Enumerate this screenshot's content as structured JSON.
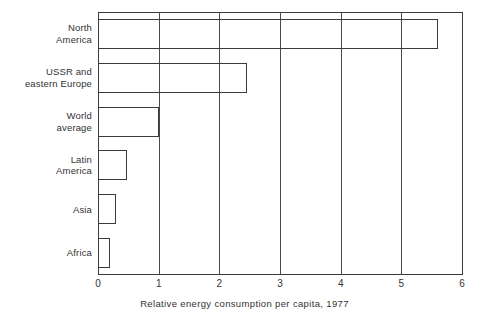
{
  "chart_data": {
    "type": "bar",
    "orientation": "horizontal",
    "title": "",
    "xlabel": "Relative energy consumption per capita, 1977",
    "ylabel": "",
    "categories": [
      "North\nAmerica",
      "USSR and\neastern Europe",
      "World\naverage",
      "Latin\nAmerica",
      "Asia",
      "Africa"
    ],
    "values": [
      5.6,
      2.45,
      1.0,
      0.47,
      0.3,
      0.19
    ],
    "xlim": [
      0,
      6
    ],
    "xticks": [
      0,
      1,
      2,
      3,
      4,
      5,
      6
    ],
    "xtick_labels": [
      "0",
      "1",
      "2",
      "3",
      "4",
      "5",
      "6"
    ],
    "grid": true,
    "grid_axis": "x",
    "legend": false,
    "bar_fill": "none",
    "bar_edge_color": "#3a3a3a",
    "background_color": "#ffffff"
  }
}
